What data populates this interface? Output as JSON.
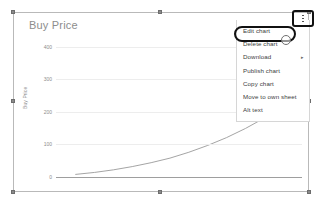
{
  "chart_data": {
    "type": "line",
    "title": "Buy Price",
    "xlabel": "",
    "ylabel": "Buy Price",
    "ylim": [
      0,
      430
    ],
    "yticks": [
      0,
      100,
      200,
      300,
      400
    ],
    "ytick_labels": [
      "0",
      "100",
      "200",
      "300",
      "400"
    ],
    "grid": true,
    "legend": "none",
    "series": [
      {
        "name": "Buy Price",
        "x": [
          0,
          1,
          2,
          3,
          4,
          5,
          6,
          7,
          8,
          9,
          10,
          11,
          12
        ],
        "values": [
          8,
          14,
          22,
          32,
          44,
          58,
          76,
          97,
          121,
          149,
          181,
          213,
          232
        ]
      }
    ]
  },
  "chart_object": {
    "selected": true,
    "title": "Buy Price"
  },
  "context_menu": {
    "items": [
      {
        "label": "Edit chart",
        "has_submenu": false
      },
      {
        "label": "Delete chart",
        "has_submenu": false
      },
      {
        "label": "Download",
        "has_submenu": true
      },
      {
        "label": "Publish chart",
        "has_submenu": false
      },
      {
        "label": "Copy chart",
        "has_submenu": false
      },
      {
        "label": "Move to own sheet",
        "has_submenu": false
      },
      {
        "label": "Alt text",
        "has_submenu": false
      }
    ],
    "submenu_arrow_glyph": "▸"
  },
  "annotations": {
    "highlighted_menu_item": "Edit chart",
    "highlighted_button": "more-options",
    "highlight_color": "#111111"
  },
  "colors": {
    "frame_border": "#b9b9b9",
    "gridline": "#ededed",
    "baseline": "#9e9e9e",
    "series_line": "#9a9a9a",
    "title_text": "#8d8d8d",
    "menu_text": "#3c3c3c",
    "menu_border": "#d6d6d6",
    "handle": "#8a8a8a"
  }
}
